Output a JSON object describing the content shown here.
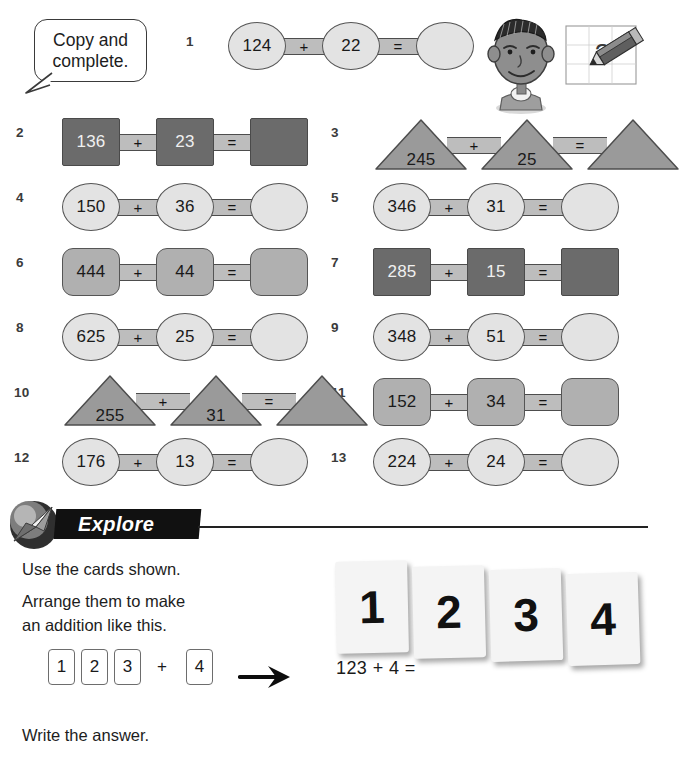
{
  "header": {
    "instruction_line1": "Copy and",
    "instruction_line2": "complete.",
    "question_mark": "?"
  },
  "problems": [
    {
      "number": "1",
      "shape": "circle",
      "tone": "light",
      "a": "124",
      "b": "22",
      "op": "+",
      "eq": "=",
      "answer": ""
    },
    {
      "number": "2",
      "shape": "square",
      "tone": "dark",
      "a": "136",
      "b": "23",
      "op": "+",
      "eq": "=",
      "answer": ""
    },
    {
      "number": "3",
      "shape": "tri",
      "tone": "medium",
      "a": "245",
      "b": "25",
      "op": "+",
      "eq": "=",
      "answer": ""
    },
    {
      "number": "4",
      "shape": "circle",
      "tone": "light",
      "a": "150",
      "b": "36",
      "op": "+",
      "eq": "=",
      "answer": ""
    },
    {
      "number": "5",
      "shape": "circle",
      "tone": "light",
      "a": "346",
      "b": "31",
      "op": "+",
      "eq": "=",
      "answer": ""
    },
    {
      "number": "6",
      "shape": "octagon",
      "tone": "medium",
      "a": "444",
      "b": "44",
      "op": "+",
      "eq": "=",
      "answer": ""
    },
    {
      "number": "7",
      "shape": "square",
      "tone": "dark",
      "a": "285",
      "b": "15",
      "op": "+",
      "eq": "=",
      "answer": ""
    },
    {
      "number": "8",
      "shape": "circle",
      "tone": "light",
      "a": "625",
      "b": "25",
      "op": "+",
      "eq": "=",
      "answer": ""
    },
    {
      "number": "9",
      "shape": "circle",
      "tone": "light",
      "a": "348",
      "b": "51",
      "op": "+",
      "eq": "=",
      "answer": ""
    },
    {
      "number": "10",
      "shape": "tri",
      "tone": "medium",
      "a": "255",
      "b": "31",
      "op": "+",
      "eq": "=",
      "answer": ""
    },
    {
      "number": "11",
      "shape": "octagon",
      "tone": "medium",
      "a": "152",
      "b": "34",
      "op": "+",
      "eq": "=",
      "answer": ""
    },
    {
      "number": "12",
      "shape": "circle",
      "tone": "light",
      "a": "176",
      "b": "13",
      "op": "+",
      "eq": "=",
      "answer": ""
    },
    {
      "number": "13",
      "shape": "circle",
      "tone": "light",
      "a": "224",
      "b": "24",
      "op": "+",
      "eq": "=",
      "answer": ""
    }
  ],
  "explore": {
    "banner_label": "Explore",
    "line1": "Use the cards shown.",
    "line2": "Arrange them to make",
    "line3": "an addition like this.",
    "line4": "Write the answer.",
    "mini_cards": [
      "1",
      "2",
      "3",
      "4"
    ],
    "mini_operator": "+",
    "big_cards": [
      "1",
      "2",
      "3",
      "4"
    ],
    "equation": "123 + 4 ="
  },
  "colors": {
    "dark_shape": "#6b6b6b",
    "medium_shape": "#b0b0b0",
    "triangle_shape": "#9a9a9a",
    "light_shape": "#e3e3e3",
    "connector": "#bdbdbd",
    "banner_bg": "#111111",
    "ink": "#1a1a1a"
  }
}
